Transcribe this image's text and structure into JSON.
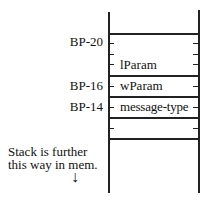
{
  "diagram": {
    "title": "",
    "offsets": [
      {
        "label": "BP-20",
        "y": 41
      },
      {
        "label": "BP-16",
        "y": 85
      },
      {
        "label": "BP-14",
        "y": 106
      }
    ],
    "cells": [
      {
        "label": "lParam"
      },
      {
        "label": "wParam"
      },
      {
        "label": "message-type"
      }
    ],
    "note": {
      "line1": "Stack is further",
      "line2": "this way in mem.",
      "arrow": "↓"
    }
  }
}
